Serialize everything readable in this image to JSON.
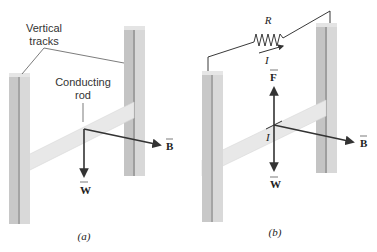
{
  "panels": [
    {
      "id": "a",
      "caption": "(a)",
      "labels": {
        "tracks": [
          "Vertical",
          "tracks"
        ],
        "rod": [
          "Conducting",
          "rod"
        ]
      },
      "vectors": {
        "weight": "W",
        "field": "B"
      }
    },
    {
      "id": "b",
      "caption": "(b)",
      "circuit": {
        "resistor": "R",
        "current": "I"
      },
      "vectors": {
        "force": "F",
        "weight": "W",
        "field": "B",
        "current_on_rod": "I"
      }
    }
  ],
  "colors": {
    "track": "#c9c9c9",
    "track_dark": "#a9a9a9",
    "track_light": "#e2e2e2",
    "rod": "#e6e6e6",
    "arrow": "#333333",
    "wire": "#222222"
  }
}
